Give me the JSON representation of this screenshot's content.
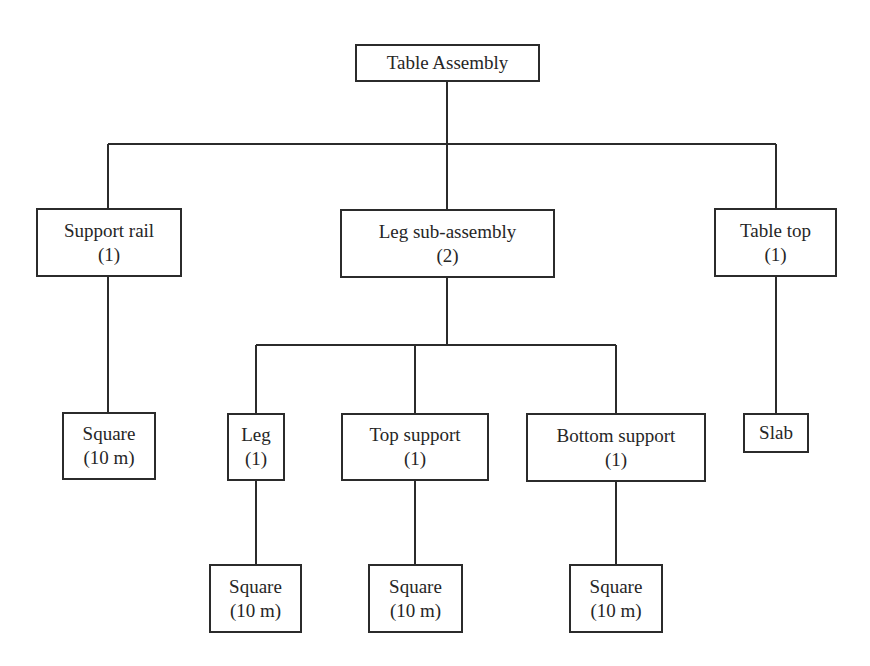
{
  "diagram": {
    "type": "tree",
    "title": "Table Assembly",
    "colors": {
      "line": "#2b2b2b",
      "box_border": "#2b2b2b",
      "text": "#262626",
      "background": "#ffffff"
    },
    "nodes": {
      "root": {
        "label": "Table Assembly",
        "qty": ""
      },
      "support_rail": {
        "label": "Support rail",
        "qty": "(1)"
      },
      "leg_sub_assembly": {
        "label": "Leg sub-assembly",
        "qty": "(2)"
      },
      "table_top": {
        "label": "Table top",
        "qty": "(1)"
      },
      "support_rail_square": {
        "label": "Square",
        "qty": "(10 m)"
      },
      "leg": {
        "label": "Leg",
        "qty": "(1)"
      },
      "top_support": {
        "label": "Top support",
        "qty": "(1)"
      },
      "bottom_support": {
        "label": "Bottom support",
        "qty": "(1)"
      },
      "slab": {
        "label": "Slab",
        "qty": ""
      },
      "leg_square": {
        "label": "Square",
        "qty": "(10 m)"
      },
      "top_support_square": {
        "label": "Square",
        "qty": "(10 m)"
      },
      "bottom_support_square": {
        "label": "Square",
        "qty": "(10 m)"
      }
    },
    "edges": [
      [
        "root",
        "support_rail"
      ],
      [
        "root",
        "leg_sub_assembly"
      ],
      [
        "root",
        "table_top"
      ],
      [
        "support_rail",
        "support_rail_square"
      ],
      [
        "leg_sub_assembly",
        "leg"
      ],
      [
        "leg_sub_assembly",
        "top_support"
      ],
      [
        "leg_sub_assembly",
        "bottom_support"
      ],
      [
        "table_top",
        "slab"
      ],
      [
        "leg",
        "leg_square"
      ],
      [
        "top_support",
        "top_support_square"
      ],
      [
        "bottom_support",
        "bottom_support_square"
      ]
    ]
  }
}
